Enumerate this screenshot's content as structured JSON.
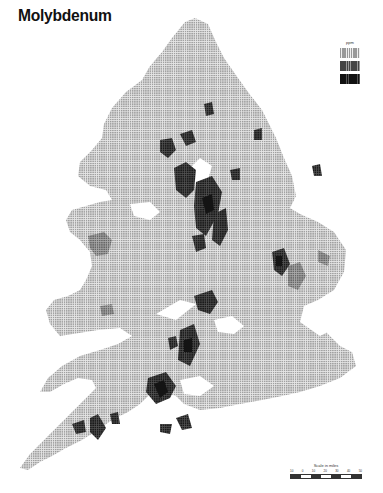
{
  "title": "Molybdenum",
  "legend": {
    "title": "ppm",
    "classes": [
      {
        "label": "low",
        "color": "#c8c8c8"
      },
      {
        "label": "medium",
        "color": "#8a8a8a"
      },
      {
        "label": "high",
        "color": "#3a3a3a"
      },
      {
        "label": "very high",
        "color": "#1a1a1a"
      }
    ]
  },
  "scale": {
    "title": "Scale in miles",
    "ticks": [
      "10",
      "0",
      "10",
      "20",
      "30",
      "40",
      "50"
    ]
  },
  "colors": {
    "base_fill": "#cfcfcf",
    "medium": "#8e8e8e",
    "high": "#3c3c3c",
    "very_high": "#151515",
    "background": "#ffffff"
  }
}
